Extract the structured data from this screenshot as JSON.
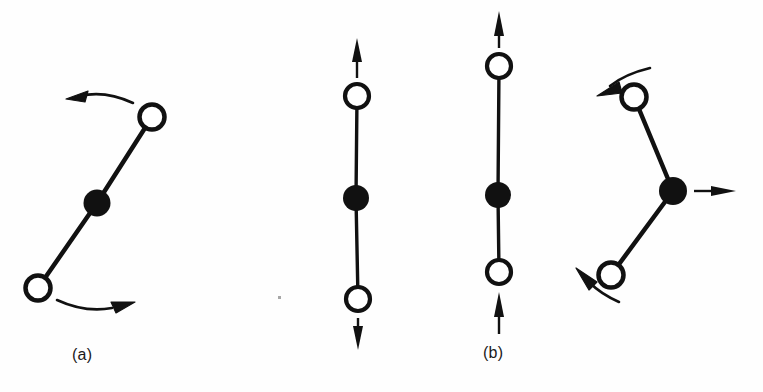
{
  "figure": {
    "type": "scientific-diagram",
    "background_color": "#fefefe",
    "ink_color": "#111111",
    "panel_labels": [
      {
        "id": "a",
        "text": "(a)",
        "x": 95,
        "y": 356
      },
      {
        "id": "b",
        "text": "(b)",
        "x": 503,
        "y": 354
      }
    ],
    "atoms": {
      "open_circle_radius": 12,
      "filled_circle_radius": 13,
      "open_circle_stroke_width": 4,
      "bond_stroke_width": 4
    },
    "diagrams": [
      {
        "name": "bending-mode-left",
        "label": "(a)",
        "geometry": "bent-near-linear",
        "center_atom": {
          "x": 97,
          "y": 203,
          "fill": "solid"
        },
        "outer_atoms": [
          {
            "id": "top",
            "x": 152,
            "y": 117,
            "fill": "open"
          },
          {
            "id": "bottom",
            "x": 38,
            "y": 288,
            "fill": "open"
          }
        ],
        "arrows": [
          {
            "id": "top-curved-left",
            "style": "curved",
            "direction": "left",
            "tip_x": 68,
            "tip_y": 98
          },
          {
            "id": "bottom-curved-right",
            "style": "curved",
            "direction": "right",
            "tip_x": 133,
            "tip_y": 305
          }
        ]
      },
      {
        "name": "symmetric-stretch",
        "label": "",
        "geometry": "linear",
        "center_atom": {
          "x": 356,
          "y": 198,
          "fill": "solid"
        },
        "outer_atoms": [
          {
            "id": "top",
            "x": 357,
            "y": 96,
            "fill": "open"
          },
          {
            "id": "bottom",
            "x": 358,
            "y": 299,
            "fill": "open"
          }
        ],
        "arrows": [
          {
            "id": "top-straight-up",
            "style": "straight",
            "direction": "up",
            "tip_x": 357,
            "tip_y": 42
          },
          {
            "id": "bottom-straight-down",
            "style": "straight",
            "direction": "down",
            "tip_x": 358,
            "tip_y": 346
          }
        ]
      },
      {
        "name": "asymmetric-stretch",
        "label": "(b)",
        "geometry": "linear",
        "center_atom": {
          "x": 498,
          "y": 195,
          "fill": "solid"
        },
        "outer_atoms": [
          {
            "id": "top",
            "x": 499,
            "y": 66,
            "fill": "open"
          },
          {
            "id": "bottom",
            "x": 499,
            "y": 272,
            "fill": "open"
          }
        ],
        "arrows": [
          {
            "id": "top-straight-up",
            "style": "straight",
            "direction": "up",
            "tip_x": 499,
            "tip_y": 14
          },
          {
            "id": "bottom-straight-up",
            "style": "straight",
            "direction": "up",
            "tip_x": 499,
            "tip_y": 295
          }
        ]
      },
      {
        "name": "bending-mode-right",
        "label": "",
        "geometry": "bent-apex-right",
        "center_atom": {
          "x": 673,
          "y": 191,
          "fill": "solid"
        },
        "outer_atoms": [
          {
            "id": "top",
            "x": 634,
            "y": 97,
            "fill": "open"
          },
          {
            "id": "bottom",
            "x": 611,
            "y": 275,
            "fill": "open"
          }
        ],
        "arrows": [
          {
            "id": "top-curved-left",
            "style": "curved",
            "direction": "left",
            "tip_x": 599,
            "tip_y": 88
          },
          {
            "id": "center-straight-right",
            "style": "straight",
            "direction": "right",
            "tip_x": 733,
            "tip_y": 191
          },
          {
            "id": "bottom-curved-upleft",
            "style": "curved",
            "direction": "up-left",
            "tip_x": 578,
            "tip_y": 274
          }
        ]
      }
    ],
    "artifacts": [
      {
        "id": "scan-speck",
        "x": 279,
        "y": 297,
        "size": 3
      }
    ]
  }
}
